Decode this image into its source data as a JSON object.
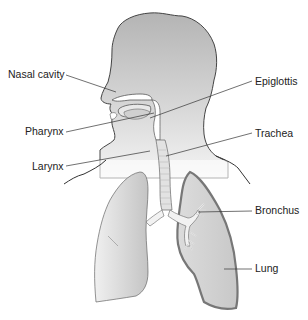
{
  "diagram": {
    "title_cutoff": "",
    "labels": [
      {
        "id": "nasal-cavity",
        "text": "Nasal cavity",
        "x": 8,
        "y": 68
      },
      {
        "id": "pharynx",
        "text": "Pharynx",
        "x": 25,
        "y": 125
      },
      {
        "id": "larynx",
        "text": "Larynx",
        "x": 32,
        "y": 160
      },
      {
        "id": "epiglottis",
        "text": "Epiglottis",
        "x": 255,
        "y": 75
      },
      {
        "id": "trachea",
        "text": "Trachea",
        "x": 255,
        "y": 127
      },
      {
        "id": "bronchus",
        "text": "Bronchus",
        "x": 255,
        "y": 204
      },
      {
        "id": "lung",
        "text": "Lung",
        "x": 255,
        "y": 262
      }
    ],
    "colors": {
      "head_fill": "#b8b8b8",
      "head_fade": "#f2f2f2",
      "outline": "#444444",
      "lung_fill": "#cfcfcf",
      "lung_border": "#777777",
      "airway_fill": "#e6e6e6",
      "leader_line": "#333333"
    }
  }
}
